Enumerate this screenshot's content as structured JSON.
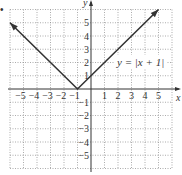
{
  "bullet": "•",
  "chart_data": {
    "type": "line",
    "title": "",
    "equation_label": "y = |x + 1|",
    "xlabel": "x",
    "ylabel": "y",
    "xlim": [
      -6,
      6
    ],
    "ylim": [
      -6,
      6
    ],
    "grid": true,
    "x_ticks": [
      -5,
      -4,
      -3,
      -2,
      -1,
      1,
      2,
      3,
      4,
      5
    ],
    "y_ticks": [
      -5,
      -4,
      -3,
      -2,
      -1,
      1,
      2,
      3,
      4,
      5
    ],
    "x_tick_labels": [
      "−5",
      "−4",
      "−3",
      "−2",
      "−1",
      "1",
      "2",
      "3",
      "4",
      "5"
    ],
    "y_tick_labels": [
      "−5",
      "−4",
      "−3",
      "−2",
      "−1",
      "1",
      "2",
      "3",
      "4",
      "5"
    ],
    "series": [
      {
        "name": "y = |x + 1|",
        "x": [
          -6,
          -1,
          5
        ],
        "y": [
          5,
          0,
          6
        ],
        "arrows_at_ends": true
      }
    ],
    "color": "#333333"
  }
}
